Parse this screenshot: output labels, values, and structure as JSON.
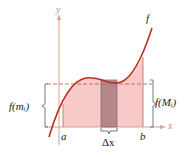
{
  "labels": {
    "y_axis": "y",
    "x_axis": "x",
    "function": "f",
    "a": "a",
    "b": "b",
    "delta_x": "Δx",
    "min_label": "f(mᵢ)",
    "max_label": "f(Mᵢ)"
  },
  "colors": {
    "curve": "#b8321e",
    "fill": "#f7c3c3",
    "rect": "#a0707a",
    "axis": "#d9a090",
    "bracket": "#555555",
    "dashed": "#c05040"
  }
}
